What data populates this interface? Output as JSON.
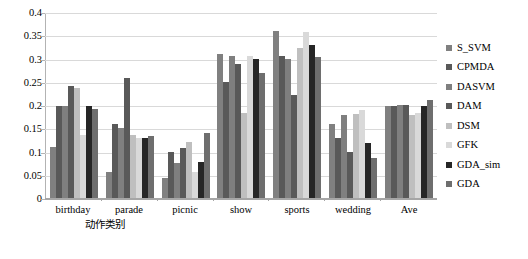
{
  "chart_data": {
    "type": "bar",
    "title": "",
    "xlabel": "动作类别",
    "ylabel": "",
    "ylim": [
      0,
      0.4
    ],
    "yticks": [
      "0",
      "0.05",
      "0.1",
      "0.15",
      "0.2",
      "0.25",
      "0.3",
      "0.35",
      "0.4"
    ],
    "ytick_values": [
      0,
      0.05,
      0.1,
      0.15,
      0.2,
      0.25,
      0.3,
      0.35,
      0.4
    ],
    "grid": "horizontal",
    "legend_position": "right",
    "categories": [
      "birthday",
      "parade",
      "picnic",
      "show",
      "sports",
      "wedding",
      "Ave"
    ],
    "series": [
      {
        "name": "S_SVM",
        "color": "#808080",
        "values": [
          0.11,
          0.055,
          0.042,
          0.31,
          0.36,
          0.16,
          0.197
        ]
      },
      {
        "name": "CPMDA",
        "color": "#595959",
        "values": [
          0.197,
          0.16,
          0.098,
          0.249,
          0.305,
          0.128,
          0.197
        ]
      },
      {
        "name": "DASVM",
        "color": "#7f7f7f",
        "values": [
          0.198,
          0.15,
          0.075,
          0.305,
          0.3,
          0.178,
          0.2
        ]
      },
      {
        "name": "DAM",
        "color": "#595959",
        "values": [
          0.24,
          0.258,
          0.108,
          0.288,
          0.222,
          0.098,
          0.2
        ]
      },
      {
        "name": "DSM",
        "color": "#bfbfbf",
        "values": [
          0.237,
          0.135,
          0.12,
          0.182,
          0.322,
          0.18,
          0.178
        ]
      },
      {
        "name": "GFK",
        "color": "#d9d9d9",
        "values": [
          0.135,
          0.128,
          0.056,
          0.305,
          0.358,
          0.19,
          0.183
        ]
      },
      {
        "name": "GDA_sim",
        "color": "#262626",
        "values": [
          0.197,
          0.13,
          0.077,
          0.298,
          0.33,
          0.118,
          0.197
        ]
      },
      {
        "name": "GDA",
        "color": "#6e6e6e",
        "values": [
          0.192,
          0.133,
          0.14,
          0.268,
          0.303,
          0.086,
          0.21
        ]
      }
    ]
  }
}
